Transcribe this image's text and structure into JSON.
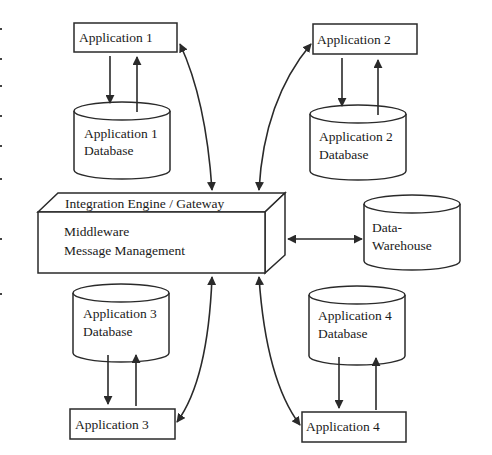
{
  "diagram": {
    "title": "",
    "colors": {
      "stroke": "#2a2a2a",
      "background": "#ffffff",
      "text": "#1a1a1a"
    },
    "applications": [
      {
        "id": "app1",
        "label": "Application 1"
      },
      {
        "id": "app2",
        "label": "Application 2"
      },
      {
        "id": "app3",
        "label": "Application 3"
      },
      {
        "id": "app4",
        "label": "Application 4"
      }
    ],
    "databases": [
      {
        "id": "db1",
        "line1": "Application 1",
        "line2": "Database"
      },
      {
        "id": "db2",
        "line1": "Application 2",
        "line2": "Database"
      },
      {
        "id": "db3",
        "line1": "Application 3",
        "line2": "Database"
      },
      {
        "id": "db4",
        "line1": "Application 4",
        "line2": "Database"
      }
    ],
    "engine": {
      "top_label": "Integration Engine / Gateway",
      "line1": "Middleware",
      "line2": "Message Management"
    },
    "warehouse": {
      "line1": "Data-",
      "line2": "Warehouse"
    },
    "connections": [
      {
        "from": "app1",
        "to": "db1",
        "type": "bidirectional-pair"
      },
      {
        "from": "app2",
        "to": "db2",
        "type": "bidirectional-pair"
      },
      {
        "from": "db3",
        "to": "app3",
        "type": "bidirectional-pair"
      },
      {
        "from": "db4",
        "to": "app4",
        "type": "bidirectional-pair"
      },
      {
        "from": "app1",
        "to": "engine",
        "type": "double-arrow-curve"
      },
      {
        "from": "app2",
        "to": "engine",
        "type": "double-arrow-curve"
      },
      {
        "from": "app3",
        "to": "engine",
        "type": "double-arrow-curve"
      },
      {
        "from": "app4",
        "to": "engine",
        "type": "double-arrow-curve"
      },
      {
        "from": "engine",
        "to": "warehouse",
        "type": "double-arrow-straight"
      }
    ]
  }
}
